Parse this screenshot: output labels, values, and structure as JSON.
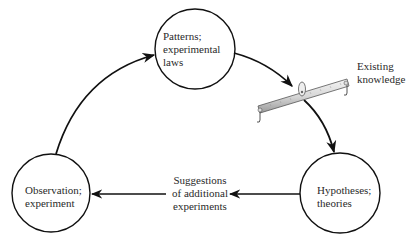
{
  "diagram": {
    "type": "cycle",
    "nodes": [
      {
        "id": "patterns",
        "lines": [
          "Patterns;",
          "experimental",
          "laws"
        ]
      },
      {
        "id": "hypotheses",
        "lines": [
          "Hypotheses;",
          "theories"
        ]
      },
      {
        "id": "observation",
        "lines": [
          "Observation;",
          "experiment"
        ]
      }
    ],
    "annotations": {
      "existing_knowledge": [
        "Existing",
        "knowledge"
      ],
      "suggestions": [
        "Suggestions",
        "of additional",
        "experiments"
      ]
    },
    "edges": [
      {
        "from": "observation",
        "to": "patterns"
      },
      {
        "from": "patterns",
        "to": "hypotheses",
        "via": "existing-knowledge-balance"
      },
      {
        "from": "hypotheses",
        "to": "observation",
        "label": "Suggestions of additional experiments"
      }
    ],
    "icons": [
      "balance-beam-icon"
    ]
  }
}
